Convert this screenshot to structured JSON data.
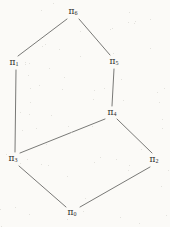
{
  "figure": {
    "type": "hasse-diagram",
    "background_color": "#fbfaf7",
    "line_color": "#6a6a68",
    "label_color": "#2b2b2b",
    "width": 170,
    "height": 227,
    "symbol": "π"
  },
  "nodes": [
    {
      "id": "pi6",
      "symbol": "π",
      "subscript": "6",
      "label": "π₆",
      "x": 73,
      "y": 12,
      "rank": 3
    },
    {
      "id": "pi1",
      "symbol": "π",
      "subscript": "1",
      "label": "π₁",
      "x": 14,
      "y": 63,
      "rank": 2
    },
    {
      "id": "pi5",
      "symbol": "π",
      "subscript": "5",
      "label": "π₅",
      "x": 114,
      "y": 62,
      "rank": 2
    },
    {
      "id": "pi4",
      "symbol": "π",
      "subscript": "4",
      "label": "π₄",
      "x": 112,
      "y": 113,
      "rank": 2
    },
    {
      "id": "pi3",
      "symbol": "π",
      "subscript": "3",
      "label": "π₃",
      "x": 13,
      "y": 159,
      "rank": 1
    },
    {
      "id": "pi2",
      "symbol": "π",
      "subscript": "2",
      "label": "π₂",
      "x": 154,
      "y": 160,
      "rank": 1
    },
    {
      "id": "pi0",
      "symbol": "π",
      "subscript": "0",
      "label": "π₀",
      "x": 72,
      "y": 213,
      "rank": 0
    }
  ],
  "edges": [
    {
      "id": "edge-pi6-pi1",
      "from": "pi6",
      "to": "pi1",
      "x1": 67,
      "y1": 19,
      "x2": 18,
      "y2": 56
    },
    {
      "id": "edge-pi6-pi5",
      "from": "pi6",
      "to": "pi5",
      "x1": 79,
      "y1": 19,
      "x2": 110,
      "y2": 55
    },
    {
      "id": "edge-pi5-pi4",
      "from": "pi5",
      "to": "pi4",
      "x1": 114,
      "y1": 69,
      "x2": 112,
      "y2": 106
    },
    {
      "id": "edge-pi1-pi3",
      "from": "pi1",
      "to": "pi3",
      "x1": 16,
      "y1": 70,
      "x2": 15,
      "y2": 152
    },
    {
      "id": "edge-pi4-pi3",
      "from": "pi4",
      "to": "pi3",
      "x1": 105,
      "y1": 119,
      "x2": 20,
      "y2": 153
    },
    {
      "id": "edge-pi4-pi2",
      "from": "pi4",
      "to": "pi2",
      "x1": 117,
      "y1": 119,
      "x2": 152,
      "y2": 153
    },
    {
      "id": "edge-pi3-pi0",
      "from": "pi3",
      "to": "pi0",
      "x1": 19,
      "y1": 166,
      "x2": 66,
      "y2": 207
    },
    {
      "id": "edge-pi2-pi0",
      "from": "pi2",
      "to": "pi0",
      "x1": 150,
      "y1": 167,
      "x2": 80,
      "y2": 207
    }
  ]
}
